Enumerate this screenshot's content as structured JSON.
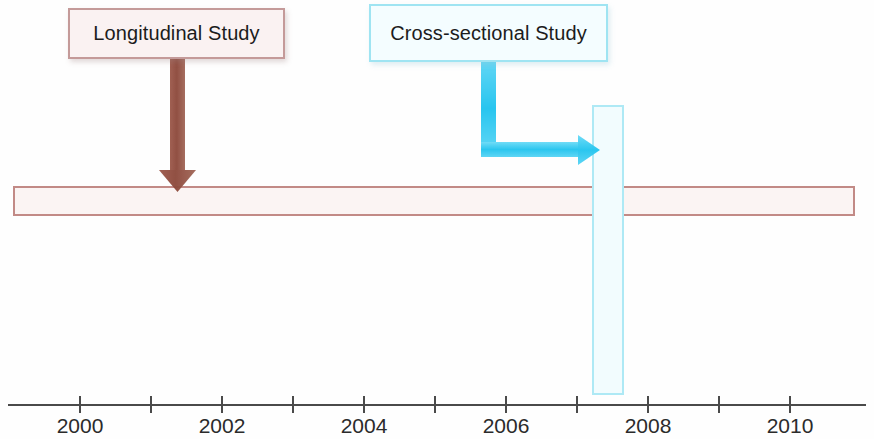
{
  "diagram": {
    "colors": {
      "longitudinal_border": "#c28a86",
      "longitudinal_fill": "#fbf4f3",
      "longitudinal_arrow": "#8a4a3c",
      "crosssectional_border": "#aee9f5",
      "crosssectional_fill": "#f2fcfe",
      "crosssectional_arrow": "#29c6ef",
      "axis": "#4a4a4a",
      "text": "#1c1c1c"
    }
  },
  "labels": {
    "longitudinal": "Longitudinal Study",
    "crosssectional": "Cross-sectional Study"
  },
  "elements": {
    "longitudinal_bar": {
      "name": "longitudinal-study-span",
      "start_year": 1999.0,
      "end_year": 2010.9
    },
    "crosssectional_bar": {
      "name": "cross-sectional-study-slice",
      "year": 2007.1
    },
    "longitudinal_arrow": {
      "name": "down-arrow",
      "points_to_year": 2001.4,
      "direction": "down"
    },
    "crosssectional_arrow": {
      "name": "elbow-arrow",
      "direction": "down-then-right",
      "points_to_year": 2007.0
    }
  },
  "axis": {
    "name": "year-timeline",
    "tick_years": [
      2000,
      2001,
      2002,
      2003,
      2004,
      2005,
      2006,
      2007,
      2008,
      2009,
      2010
    ],
    "labeled_years": [
      2000,
      2002,
      2004,
      2006,
      2008,
      2010
    ],
    "tick_labels": [
      "2000",
      "2002",
      "2004",
      "2006",
      "2008",
      "2010"
    ],
    "x_start_px": 80,
    "px_per_year": 71
  },
  "chart_data": {
    "type": "timeline",
    "xlabel": "Year",
    "xlim": [
      1999,
      2011
    ],
    "tick_labels": [
      "2000",
      "2002",
      "2004",
      "2006",
      "2008",
      "2010"
    ],
    "grid": false,
    "legend": "none",
    "series": [
      {
        "name": "Longitudinal Study",
        "shape": "horizontal-span",
        "start": 1999.0,
        "end": 2010.9,
        "annotation_at": 2001.4,
        "color": "#c28a86"
      },
      {
        "name": "Cross-sectional Study",
        "shape": "vertical-slice",
        "at": 2007.1,
        "annotation_from": 2005.6,
        "color": "#aee9f5"
      }
    ]
  }
}
